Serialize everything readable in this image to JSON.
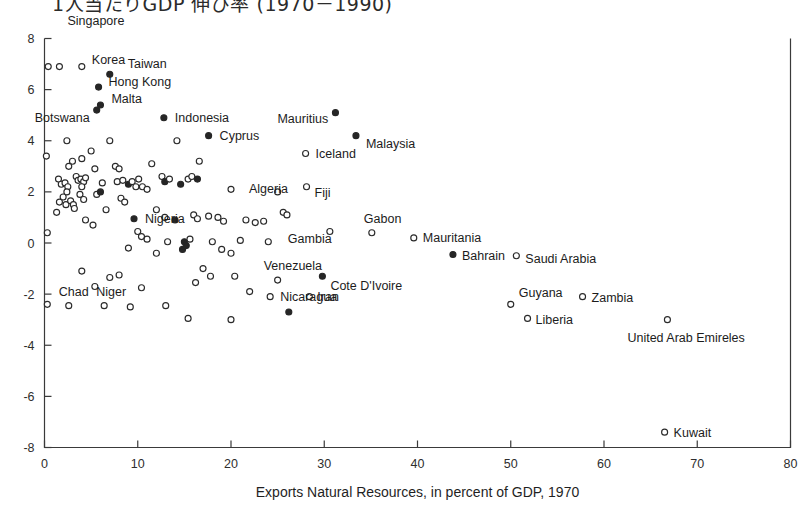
{
  "figure": {
    "title_clipped": "1人当たりGDP 伸び率 (1970－1990)",
    "background_color": "#ffffff",
    "ink_color": "#262626"
  },
  "chart_data": {
    "type": "scatter",
    "title": "1人当たりGDP 伸び率 (1970－1990)",
    "xlabel": "Exports Natural Resources, in percent of GDP, 1970",
    "ylabel": "",
    "xlim": [
      0,
      80
    ],
    "ylim": [
      -8,
      8
    ],
    "xticks": [
      0,
      10,
      20,
      30,
      40,
      50,
      60,
      70,
      80
    ],
    "yticks": [
      8,
      6,
      4,
      2,
      0,
      -2,
      -4,
      -6,
      -8
    ],
    "grid": false,
    "legend": null,
    "marker_styles": {
      "open": "hollow circle",
      "filled": "solid circle"
    },
    "labeled_points": [
      {
        "label": "Singapore",
        "x": 1.6,
        "y": 6.9,
        "marker": "open",
        "label_dx": 8,
        "label_dy": -42,
        "anchor": "start"
      },
      {
        "label": "Korea",
        "x": 4.0,
        "y": 6.9,
        "marker": "open",
        "label_dx": 10,
        "label_dy": -3,
        "anchor": "start"
      },
      {
        "label": "Taiwan",
        "x": 7.0,
        "y": 6.6,
        "marker": "filled",
        "label_dx": 18,
        "label_dy": -6,
        "anchor": "start"
      },
      {
        "label": "Hong Kong",
        "x": 5.8,
        "y": 6.1,
        "marker": "filled",
        "label_dx": 10,
        "label_dy": -1,
        "anchor": "start"
      },
      {
        "label": "Malta",
        "x": 6.0,
        "y": 5.4,
        "marker": "filled",
        "label_dx": 11,
        "label_dy": -2,
        "anchor": "start"
      },
      {
        "label": "Botswana",
        "x": 5.6,
        "y": 5.2,
        "marker": "filled",
        "label_dx": -62,
        "label_dy": 12,
        "anchor": "start"
      },
      {
        "label": "Indonesia",
        "x": 12.8,
        "y": 4.9,
        "marker": "filled",
        "label_dx": 11,
        "label_dy": 4,
        "anchor": "start"
      },
      {
        "label": "Mauritius",
        "x": 31.2,
        "y": 5.1,
        "marker": "filled",
        "label_dx": -58,
        "label_dy": 10,
        "anchor": "start"
      },
      {
        "label": "Cyprus",
        "x": 17.6,
        "y": 4.2,
        "marker": "filled",
        "label_dx": 11,
        "label_dy": 4,
        "anchor": "start"
      },
      {
        "label": "Malaysia",
        "x": 33.4,
        "y": 4.2,
        "marker": "filled",
        "label_dx": 10,
        "label_dy": 12,
        "anchor": "start"
      },
      {
        "label": "Iceland",
        "x": 28.0,
        "y": 3.5,
        "marker": "open",
        "label_dx": 10,
        "label_dy": 4,
        "anchor": "start"
      },
      {
        "label": "Algeria",
        "x": 20.0,
        "y": 2.1,
        "marker": "open",
        "label_dx": 18,
        "label_dy": 4,
        "anchor": "start"
      },
      {
        "label": "Fiji",
        "x": 28.1,
        "y": 2.2,
        "marker": "open",
        "label_dx": 8,
        "label_dy": 10,
        "anchor": "start"
      },
      {
        "label": "Nigeria",
        "x": 9.6,
        "y": 0.95,
        "marker": "filled",
        "label_dx": 11,
        "label_dy": 4,
        "anchor": "start"
      },
      {
        "label": "Gabon",
        "x": 35.1,
        "y": 0.4,
        "marker": "open",
        "label_dx": -8,
        "label_dy": -10,
        "anchor": "start"
      },
      {
        "label": "Gambia",
        "x": 30.6,
        "y": 0.45,
        "marker": "open",
        "label_dx": -42,
        "label_dy": 12,
        "anchor": "start"
      },
      {
        "label": "Mauritania",
        "x": 39.6,
        "y": 0.2,
        "marker": "open",
        "label_dx": 9,
        "label_dy": 4,
        "anchor": "start"
      },
      {
        "label": "Bahrain",
        "x": 43.8,
        "y": -0.45,
        "marker": "filled",
        "label_dx": 9,
        "label_dy": 5,
        "anchor": "start"
      },
      {
        "label": "Saudi Arabia",
        "x": 50.6,
        "y": -0.5,
        "marker": "open",
        "label_dx": 9,
        "label_dy": 7,
        "anchor": "start"
      },
      {
        "label": "Venezuela",
        "x": 25.0,
        "y": -1.45,
        "marker": "open",
        "label_dx": -14,
        "label_dy": -10,
        "anchor": "start"
      },
      {
        "label": "Cote D'Ivoire",
        "x": 29.8,
        "y": -1.3,
        "marker": "filled",
        "label_dx": 8,
        "label_dy": 14,
        "anchor": "start"
      },
      {
        "label": "Nicaragua",
        "x": 24.2,
        "y": -2.1,
        "marker": "open",
        "label_dx": 10,
        "label_dy": 4,
        "anchor": "start"
      },
      {
        "label": "Iran",
        "x": 28.4,
        "y": -2.1,
        "marker": "open",
        "label_dx": 8,
        "label_dy": 4,
        "anchor": "start"
      },
      {
        "label": "Chad",
        "x": 2.6,
        "y": -2.45,
        "marker": "open",
        "label_dx": -10,
        "label_dy": -10,
        "anchor": "start"
      },
      {
        "label": "Niger",
        "x": 6.4,
        "y": -2.45,
        "marker": "open",
        "label_dx": -8,
        "label_dy": -10,
        "anchor": "start"
      },
      {
        "label": "Guyana",
        "x": 50.0,
        "y": -2.4,
        "marker": "open",
        "label_dx": 8,
        "label_dy": -7,
        "anchor": "start"
      },
      {
        "label": "Zambia",
        "x": 57.7,
        "y": -2.1,
        "marker": "open",
        "label_dx": 9,
        "label_dy": 5,
        "anchor": "start"
      },
      {
        "label": "Liberia",
        "x": 51.8,
        "y": -2.95,
        "marker": "open",
        "label_dx": 8,
        "label_dy": 6,
        "anchor": "start"
      },
      {
        "label": "United Arab Emireles",
        "x": 66.8,
        "y": -3.0,
        "marker": "open",
        "label_dx": -40,
        "label_dy": 22,
        "anchor": "start"
      },
      {
        "label": "Kuwait",
        "x": 66.5,
        "y": -7.4,
        "marker": "open",
        "label_dx": 9,
        "label_dy": 5,
        "anchor": "start"
      }
    ],
    "unlabeled_points": [
      {
        "x": 0.4,
        "y": 6.9,
        "marker": "open"
      },
      {
        "x": 0.2,
        "y": 3.4,
        "marker": "open"
      },
      {
        "x": 0.3,
        "y": 0.4,
        "marker": "open"
      },
      {
        "x": 0.3,
        "y": -2.4,
        "marker": "open"
      },
      {
        "x": 2.4,
        "y": 4.0,
        "marker": "open"
      },
      {
        "x": 3.0,
        "y": 3.2,
        "marker": "open"
      },
      {
        "x": 2.6,
        "y": 3.0,
        "marker": "open"
      },
      {
        "x": 1.5,
        "y": 2.5,
        "marker": "open"
      },
      {
        "x": 1.8,
        "y": 2.3,
        "marker": "open"
      },
      {
        "x": 2.2,
        "y": 2.35,
        "marker": "open"
      },
      {
        "x": 2.5,
        "y": 2.2,
        "marker": "open"
      },
      {
        "x": 2.4,
        "y": 2.0,
        "marker": "open"
      },
      {
        "x": 2.0,
        "y": 1.8,
        "marker": "open"
      },
      {
        "x": 1.6,
        "y": 1.6,
        "marker": "open"
      },
      {
        "x": 2.3,
        "y": 1.5,
        "marker": "open"
      },
      {
        "x": 2.8,
        "y": 1.65,
        "marker": "open"
      },
      {
        "x": 3.1,
        "y": 1.5,
        "marker": "open"
      },
      {
        "x": 1.3,
        "y": 1.2,
        "marker": "open"
      },
      {
        "x": 3.4,
        "y": 2.6,
        "marker": "open"
      },
      {
        "x": 3.6,
        "y": 2.45,
        "marker": "open"
      },
      {
        "x": 3.9,
        "y": 2.5,
        "marker": "open"
      },
      {
        "x": 4.2,
        "y": 2.4,
        "marker": "open"
      },
      {
        "x": 4.0,
        "y": 2.2,
        "marker": "open"
      },
      {
        "x": 4.4,
        "y": 2.55,
        "marker": "open"
      },
      {
        "x": 3.8,
        "y": 1.9,
        "marker": "open"
      },
      {
        "x": 4.2,
        "y": 1.7,
        "marker": "open"
      },
      {
        "x": 3.2,
        "y": 1.35,
        "marker": "open"
      },
      {
        "x": 4.4,
        "y": 0.9,
        "marker": "open"
      },
      {
        "x": 4.0,
        "y": 3.3,
        "marker": "open"
      },
      {
        "x": 5.0,
        "y": 3.6,
        "marker": "open"
      },
      {
        "x": 5.4,
        "y": 2.9,
        "marker": "open"
      },
      {
        "x": 6.2,
        "y": 2.35,
        "marker": "open"
      },
      {
        "x": 5.6,
        "y": 1.9,
        "marker": "open"
      },
      {
        "x": 6.0,
        "y": 2.0,
        "marker": "filled"
      },
      {
        "x": 6.6,
        "y": 1.3,
        "marker": "open"
      },
      {
        "x": 5.2,
        "y": 0.7,
        "marker": "open"
      },
      {
        "x": 7.0,
        "y": 4.0,
        "marker": "open"
      },
      {
        "x": 7.6,
        "y": 3.0,
        "marker": "open"
      },
      {
        "x": 8.0,
        "y": 2.9,
        "marker": "open"
      },
      {
        "x": 7.8,
        "y": 2.4,
        "marker": "open"
      },
      {
        "x": 8.4,
        "y": 2.45,
        "marker": "open"
      },
      {
        "x": 8.2,
        "y": 1.75,
        "marker": "open"
      },
      {
        "x": 8.6,
        "y": 1.6,
        "marker": "open"
      },
      {
        "x": 9.0,
        "y": 2.3,
        "marker": "filled"
      },
      {
        "x": 9.4,
        "y": 2.4,
        "marker": "open"
      },
      {
        "x": 9.8,
        "y": 2.2,
        "marker": "open"
      },
      {
        "x": 10.1,
        "y": 2.5,
        "marker": "open"
      },
      {
        "x": 10.5,
        "y": 2.2,
        "marker": "open"
      },
      {
        "x": 11.0,
        "y": 2.1,
        "marker": "open"
      },
      {
        "x": 12.6,
        "y": 2.6,
        "marker": "open"
      },
      {
        "x": 12.9,
        "y": 2.4,
        "marker": "filled"
      },
      {
        "x": 13.4,
        "y": 2.5,
        "marker": "open"
      },
      {
        "x": 14.6,
        "y": 2.3,
        "marker": "filled"
      },
      {
        "x": 11.5,
        "y": 3.1,
        "marker": "open"
      },
      {
        "x": 12.0,
        "y": 1.3,
        "marker": "open"
      },
      {
        "x": 12.9,
        "y": 1.0,
        "marker": "open"
      },
      {
        "x": 14.0,
        "y": 0.9,
        "marker": "filled"
      },
      {
        "x": 15.4,
        "y": 2.5,
        "marker": "open"
      },
      {
        "x": 15.8,
        "y": 2.6,
        "marker": "open"
      },
      {
        "x": 16.4,
        "y": 2.5,
        "marker": "filled"
      },
      {
        "x": 16.0,
        "y": 1.1,
        "marker": "open"
      },
      {
        "x": 16.4,
        "y": 0.95,
        "marker": "open"
      },
      {
        "x": 15.0,
        "y": 0.05,
        "marker": "filled"
      },
      {
        "x": 15.2,
        "y": -0.1,
        "marker": "filled"
      },
      {
        "x": 14.8,
        "y": -0.25,
        "marker": "filled"
      },
      {
        "x": 15.6,
        "y": 0.15,
        "marker": "open"
      },
      {
        "x": 13.2,
        "y": 0.05,
        "marker": "open"
      },
      {
        "x": 12.0,
        "y": -0.4,
        "marker": "open"
      },
      {
        "x": 10.0,
        "y": 0.45,
        "marker": "open"
      },
      {
        "x": 10.4,
        "y": 0.25,
        "marker": "open"
      },
      {
        "x": 11.0,
        "y": 0.15,
        "marker": "open"
      },
      {
        "x": 9.0,
        "y": -0.2,
        "marker": "open"
      },
      {
        "x": 17.6,
        "y": 1.05,
        "marker": "open"
      },
      {
        "x": 18.6,
        "y": 1.0,
        "marker": "open"
      },
      {
        "x": 19.2,
        "y": 0.85,
        "marker": "open"
      },
      {
        "x": 18.0,
        "y": 0.05,
        "marker": "open"
      },
      {
        "x": 19.0,
        "y": -0.25,
        "marker": "open"
      },
      {
        "x": 20.0,
        "y": -0.4,
        "marker": "open"
      },
      {
        "x": 17.0,
        "y": -1.0,
        "marker": "open"
      },
      {
        "x": 17.8,
        "y": -1.3,
        "marker": "open"
      },
      {
        "x": 16.2,
        "y": -1.55,
        "marker": "open"
      },
      {
        "x": 21.6,
        "y": 0.9,
        "marker": "open"
      },
      {
        "x": 22.6,
        "y": 0.8,
        "marker": "open"
      },
      {
        "x": 23.5,
        "y": 0.85,
        "marker": "open"
      },
      {
        "x": 21.0,
        "y": 0.1,
        "marker": "open"
      },
      {
        "x": 20.4,
        "y": -1.3,
        "marker": "open"
      },
      {
        "x": 22.0,
        "y": -1.9,
        "marker": "open"
      },
      {
        "x": 20.0,
        "y": -3.0,
        "marker": "open"
      },
      {
        "x": 7.0,
        "y": -1.35,
        "marker": "open"
      },
      {
        "x": 8.0,
        "y": -1.25,
        "marker": "open"
      },
      {
        "x": 5.4,
        "y": -1.7,
        "marker": "open"
      },
      {
        "x": 4.0,
        "y": -1.1,
        "marker": "open"
      },
      {
        "x": 10.4,
        "y": -1.75,
        "marker": "open"
      },
      {
        "x": 13.0,
        "y": -2.45,
        "marker": "open"
      },
      {
        "x": 9.2,
        "y": -2.5,
        "marker": "open"
      },
      {
        "x": 26.2,
        "y": -2.7,
        "marker": "filled"
      },
      {
        "x": 15.4,
        "y": -2.95,
        "marker": "open"
      },
      {
        "x": 25.6,
        "y": 1.2,
        "marker": "open"
      },
      {
        "x": 26.0,
        "y": 1.1,
        "marker": "open"
      },
      {
        "x": 24.0,
        "y": 0.05,
        "marker": "open"
      },
      {
        "x": 25.0,
        "y": 2.0,
        "marker": "open"
      },
      {
        "x": 14.2,
        "y": 4.0,
        "marker": "open"
      },
      {
        "x": 16.6,
        "y": 3.2,
        "marker": "open"
      }
    ]
  },
  "axis": {
    "x_tick_labels": [
      "0",
      "10",
      "20",
      "30",
      "40",
      "50",
      "60",
      "70",
      "80"
    ],
    "y_tick_labels": [
      "8",
      "6",
      "4",
      "2",
      "0",
      "-2",
      "-4",
      "-6",
      "-8"
    ],
    "x_axis_title": "Exports Natural Resources, in percent of GDP, 1970"
  }
}
